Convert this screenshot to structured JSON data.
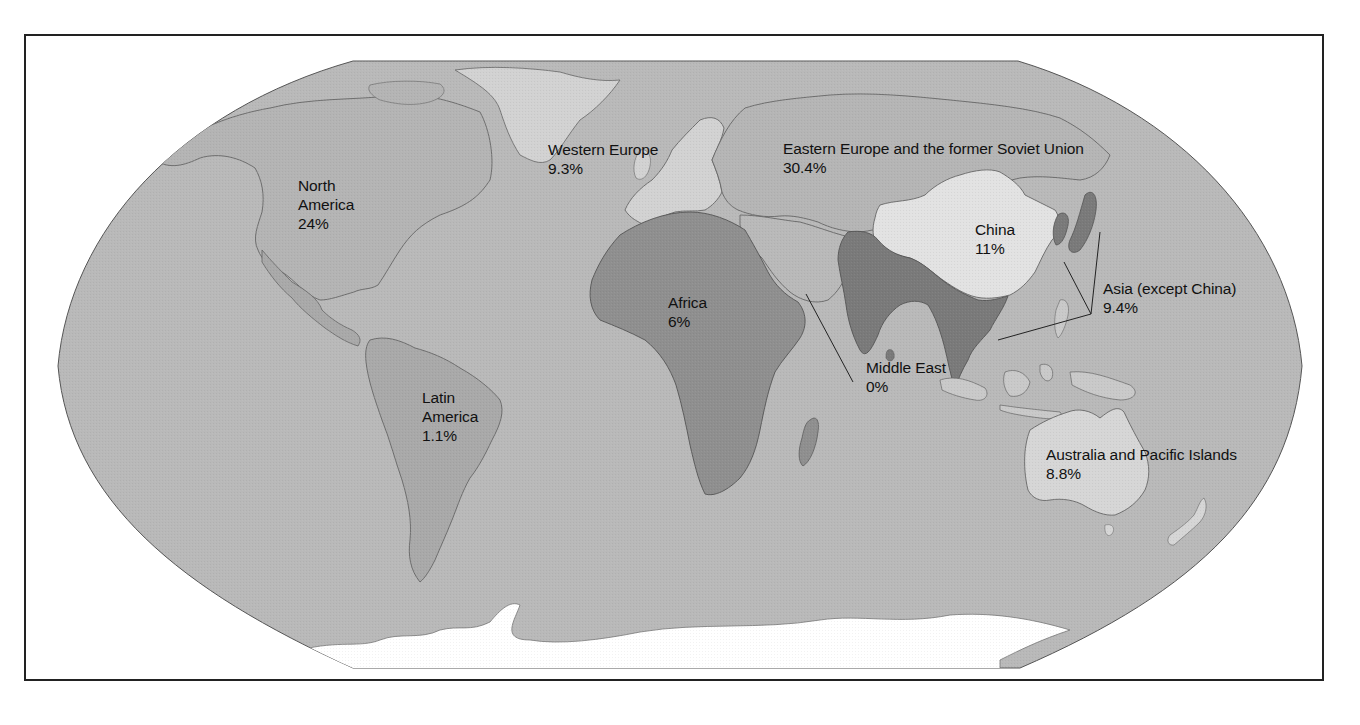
{
  "map": {
    "projection": "Robinson",
    "colors": {
      "ocean": "#b9b9b9",
      "land_default": "#b3b3b3",
      "north_america": "#b4b4b4",
      "latin_america": "#a9a9a9",
      "western_europe": "#d2d2d2",
      "eastern_europe_former_soviet_union": "#b5b5b5",
      "middle_east": "#b9b9b9",
      "africa": "#8f8f8f",
      "china": "#e2e2e2",
      "asia_except_china": "#7a7a7a",
      "southeast_asia": "#c9c9c9",
      "australia_pacific": "#d6d6d6",
      "antarctica": "#ffffff",
      "frame": "#222222"
    }
  },
  "regions": [
    {
      "id": "north_america",
      "name_lines": [
        "North",
        "America"
      ],
      "value": "24%"
    },
    {
      "id": "western_europe",
      "name_lines": [
        "Western Europe"
      ],
      "value": "9.3%"
    },
    {
      "id": "eastern_europe",
      "name_lines": [
        "Eastern Europe and the former Soviet Union"
      ],
      "value": "30.4%"
    },
    {
      "id": "china",
      "name_lines": [
        "China"
      ],
      "value": "11%"
    },
    {
      "id": "asia_except_china",
      "name_lines": [
        "Asia (except China)"
      ],
      "value": "9.4%"
    },
    {
      "id": "africa",
      "name_lines": [
        "Africa"
      ],
      "value": "6%"
    },
    {
      "id": "middle_east",
      "name_lines": [
        "Middle East"
      ],
      "value": "0%"
    },
    {
      "id": "latin_america",
      "name_lines": [
        "Latin",
        "America"
      ],
      "value": "1.1%"
    },
    {
      "id": "australia_pacific",
      "name_lines": [
        "Australia and Pacific Islands"
      ],
      "value": "8.8%"
    }
  ]
}
